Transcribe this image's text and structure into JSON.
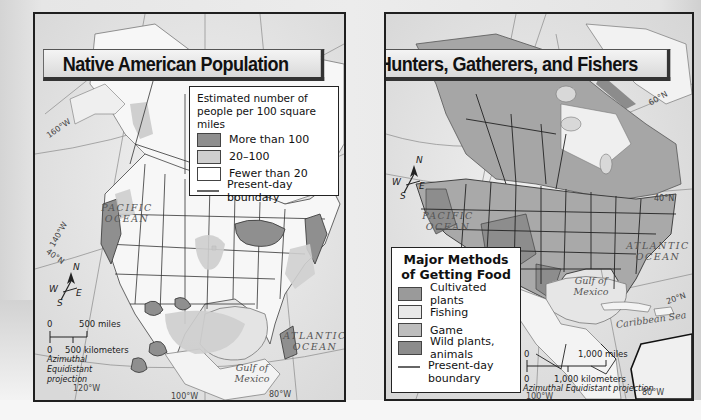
{
  "maps": {
    "left": {
      "title": "Native American Population",
      "legend": {
        "heading": "Estimated number of people per 100 square miles",
        "items": [
          {
            "label": "More than 100",
            "color": "#8f8f8f"
          },
          {
            "label": "20–100",
            "color": "#cfcfcf"
          },
          {
            "label": "Fewer than 20",
            "color": "#ffffff"
          },
          {
            "label": "Present-day boundary",
            "type": "line",
            "color": "#666666"
          }
        ]
      },
      "labels": {
        "pacific": "PACIFIC\nOCEAN",
        "atlantic": "ATLANTIC\nOCEAN",
        "gulf": "Gulf of\nMexico"
      },
      "coords": [
        "160°W",
        "140°W",
        "40°N",
        "120°W",
        "100°W",
        "80°W"
      ],
      "compass": {
        "n": "N",
        "s": "S",
        "e": "E",
        "w": "W"
      },
      "scale": {
        "zero_top": "0",
        "miles": "500 miles",
        "zero_bottom": "0",
        "km": "500 kilometers",
        "projection": "Azimuthal Equidistant projection"
      }
    },
    "right": {
      "title": "Hunters, Gatherers, and Fishers",
      "legend": {
        "heading": "Major Methods of Getting Food",
        "items": [
          {
            "label": "Cultivated plants",
            "color": "#9a9a9a"
          },
          {
            "label": "Fishing",
            "color": "#e9e9e9"
          },
          {
            "label": "Game",
            "color": "#bdbdbd"
          },
          {
            "label": "Wild plants, animals",
            "color": "#8c8c8c"
          },
          {
            "label": "Present-day boundary",
            "type": "line",
            "color": "#666666"
          }
        ]
      },
      "labels": {
        "pacific": "PACIFIC\nOCEAN",
        "atlantic": "ATLANTIC\nOCEAN",
        "gulf": "Gulf of\nMexico",
        "caribbean": "Caribbean Sea"
      },
      "coords": [
        "60°N",
        "40°N",
        "20°N",
        "100°W",
        "80°W"
      ],
      "compass": {
        "n": "N",
        "s": "S",
        "e": "E",
        "w": "W"
      },
      "scale": {
        "zero_top": "0",
        "miles": "1,000 miles",
        "zero_bottom": "0",
        "km": "1,000 kilometers",
        "projection": "Azimuthal Equidistant projection"
      }
    }
  }
}
